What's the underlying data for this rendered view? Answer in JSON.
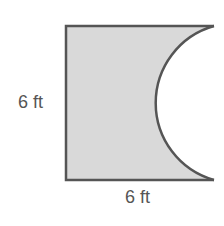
{
  "figure": {
    "colors": {
      "fill": "#d9d9d9",
      "stroke": "#555555",
      "text": "#555555"
    },
    "shape": {
      "type": "square-minus-semicircle",
      "side_length": 6,
      "unit": "ft"
    },
    "labels": {
      "left_side": "6 ft",
      "bottom_side": "6 ft"
    }
  }
}
